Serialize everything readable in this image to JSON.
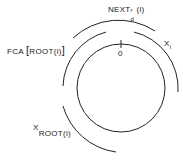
{
  "diagram": {
    "labels": {
      "next": {
        "base": "NEXT",
        "sup": "r",
        "sub": "d",
        "arg": "(i)"
      },
      "fca": {
        "prefix": "FCA",
        "open": "[",
        "arg": "ROOT(i)",
        "close": "]"
      },
      "xi": {
        "base": "X",
        "sub": "i"
      },
      "xroot": {
        "base": "X",
        "sub": "ROOT(i)"
      },
      "zero": "0"
    },
    "colors": {
      "stroke": "#222222",
      "background": "#ffffff"
    }
  }
}
